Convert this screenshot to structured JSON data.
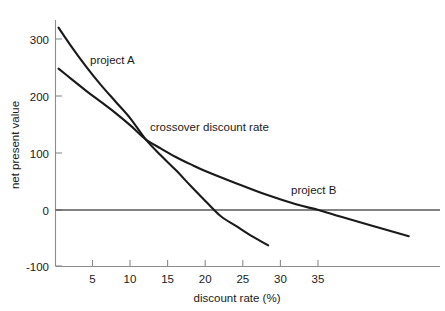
{
  "chart_data": {
    "type": "line",
    "title": "",
    "xlabel": "discount rate (%)",
    "ylabel": "net present value",
    "xlim": [
      0,
      51
    ],
    "ylim": [
      -100,
      340
    ],
    "grid": false,
    "legend_position": "inline-labels",
    "xticks": [
      5,
      10,
      15,
      20,
      25,
      30,
      35
    ],
    "xtick_labels": [
      "5",
      "10",
      "15",
      "20",
      "25",
      "30",
      "35"
    ],
    "yticks": [
      -100,
      0,
      100,
      200,
      300
    ],
    "ytick_labels": [
      "-100",
      "0",
      "100",
      "200",
      "300"
    ],
    "zero_reference_line": 0,
    "annotations": [
      {
        "text": "crossover discount rate",
        "x": 13.5,
        "y": 148,
        "describes": "intersection of project A and project B net present value curves"
      }
    ],
    "series": [
      {
        "name": "project A",
        "label": "project A",
        "label_x": 12.5,
        "label_y": 268,
        "color": "#1a1a1a",
        "points": [
          [
            0.4,
            320
          ],
          [
            2.0,
            289
          ],
          [
            4.0,
            253
          ],
          [
            6.0,
            220
          ],
          [
            8.0,
            190
          ],
          [
            10.0,
            160
          ],
          [
            12.0,
            124
          ],
          [
            14.0,
            96
          ],
          [
            16.0,
            70
          ],
          [
            18.0,
            42
          ],
          [
            20.0,
            15
          ],
          [
            22.0,
            -11
          ],
          [
            24.0,
            -28
          ],
          [
            26.0,
            -45
          ],
          [
            28.3,
            -62
          ]
        ]
      },
      {
        "name": "project B",
        "label": "project B",
        "label_x": 31.5,
        "label_y": 52,
        "color": "#1a1a1a",
        "points": [
          [
            0.4,
            248
          ],
          [
            2.0,
            231
          ],
          [
            4.0,
            210
          ],
          [
            6.0,
            190
          ],
          [
            8.0,
            170
          ],
          [
            10.0,
            148
          ],
          [
            12.0,
            124
          ],
          [
            14.0,
            108
          ],
          [
            16.0,
            93
          ],
          [
            18.0,
            80
          ],
          [
            20.0,
            68
          ],
          [
            24.0,
            47
          ],
          [
            28.0,
            27
          ],
          [
            32.0,
            10
          ],
          [
            35.0,
            0
          ],
          [
            38.0,
            -12
          ],
          [
            42.0,
            -27
          ],
          [
            47.0,
            -46
          ]
        ]
      }
    ],
    "crossover_point": {
      "x": 12,
      "y": 124
    }
  }
}
